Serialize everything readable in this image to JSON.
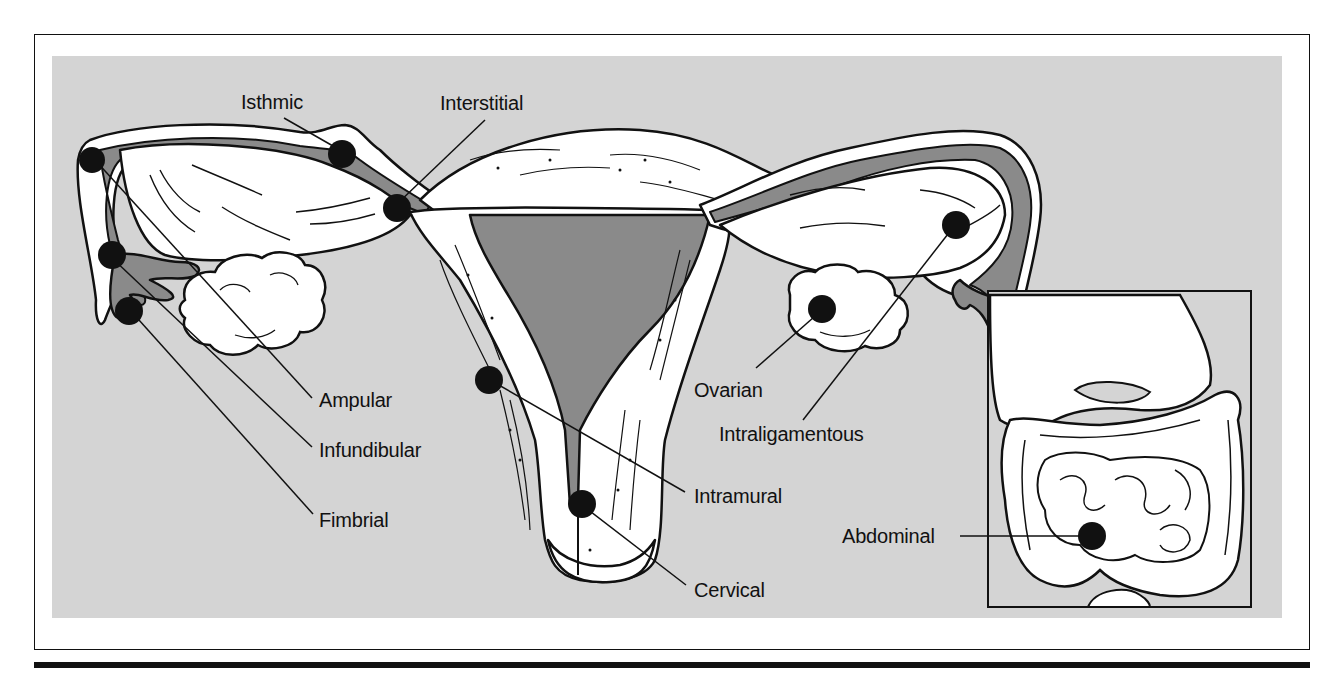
{
  "figure": {
    "type": "anatomical-diagram",
    "background_color": "#d4d4d4",
    "cavity_color": "#8a8a8a",
    "tissue_color": "#ffffff",
    "marker_color": "#111111",
    "labels": {
      "isthmic": "Isthmic",
      "interstitial": "Interstitial",
      "ampular": "Ampular",
      "infundibular": "Infundibular",
      "fimbrial": "Fimbrial",
      "intramural": "Intramural",
      "cervical": "Cervical",
      "ovarian": "Ovarian",
      "intraligamentous": "Intraligamentous",
      "abdominal": "Abdominal"
    },
    "inset": {
      "subject": "abdominal cavity with intestines"
    }
  }
}
